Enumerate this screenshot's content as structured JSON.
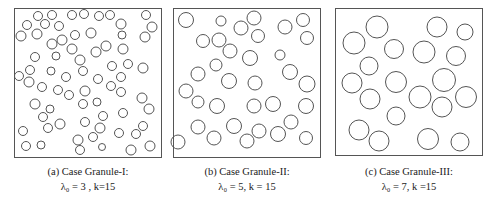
{
  "panels": [
    {
      "id": "a",
      "caption_line1": "(a) Case Granule-I:",
      "caption_line2": "λ₀ = 3 , k=15",
      "lambda0": 3,
      "k": 15,
      "box": {
        "x": 14,
        "y": 8,
        "w": 147,
        "h": 149
      },
      "stroke": "#555555",
      "circles": [
        [
          38,
          16,
          4.5
        ],
        [
          52,
          15,
          4.5
        ],
        [
          72,
          15,
          4.5
        ],
        [
          84,
          14,
          4.5
        ],
        [
          99,
          16,
          4.5
        ],
        [
          110,
          15,
          4.5
        ],
        [
          146,
          15,
          4.5
        ],
        [
          27,
          25,
          4.5
        ],
        [
          45,
          24,
          4.5
        ],
        [
          59,
          26,
          4.5
        ],
        [
          121,
          24,
          5
        ],
        [
          152,
          27,
          5
        ],
        [
          21,
          36,
          5
        ],
        [
          37,
          34,
          5
        ],
        [
          75,
          35,
          4.5
        ],
        [
          91,
          33,
          5
        ],
        [
          122,
          35,
          4
        ],
        [
          145,
          37,
          5
        ],
        [
          52,
          44,
          5
        ],
        [
          62,
          40,
          5
        ],
        [
          72,
          49,
          5
        ],
        [
          96,
          52,
          5
        ],
        [
          106,
          46,
          5
        ],
        [
          123,
          49,
          5
        ],
        [
          35,
          57,
          4.5
        ],
        [
          56,
          56,
          4
        ],
        [
          80,
          60,
          5
        ],
        [
          128,
          64,
          4.5
        ],
        [
          112,
          66,
          4.5
        ],
        [
          143,
          68,
          5
        ],
        [
          30,
          70,
          4.5
        ],
        [
          51,
          71,
          4
        ],
        [
          83,
          71,
          4.5
        ],
        [
          19,
          76,
          4.5
        ],
        [
          29,
          82,
          5
        ],
        [
          66,
          77,
          4.5
        ],
        [
          98,
          79,
          4.5
        ],
        [
          121,
          77,
          4.5
        ],
        [
          42,
          87,
          4.5
        ],
        [
          58,
          90,
          4.5
        ],
        [
          69,
          95,
          4.5
        ],
        [
          85,
          91,
          5
        ],
        [
          111,
          86,
          4.5
        ],
        [
          121,
          92,
          4.5
        ],
        [
          142,
          98,
          5
        ],
        [
          35,
          104,
          5
        ],
        [
          50,
          109,
          4
        ],
        [
          83,
          104,
          4.5
        ],
        [
          97,
          102,
          4
        ],
        [
          149,
          109,
          5
        ],
        [
          43,
          117,
          4.5
        ],
        [
          60,
          124,
          5
        ],
        [
          103,
          116,
          4.5
        ],
        [
          123,
          113,
          4.5
        ],
        [
          48,
          128,
          4.5
        ],
        [
          85,
          122,
          4.5
        ],
        [
          100,
          128,
          5
        ],
        [
          23,
          131,
          4.5
        ],
        [
          143,
          126,
          4.5
        ],
        [
          119,
          133,
          4.5
        ],
        [
          136,
          134,
          4.5
        ],
        [
          26,
          146,
          4.5
        ],
        [
          41,
          145,
          4
        ],
        [
          78,
          140,
          5
        ],
        [
          93,
          137,
          4.5
        ],
        [
          80,
          150,
          4.5
        ],
        [
          102,
          147,
          3.5
        ],
        [
          131,
          150,
          5
        ],
        [
          150,
          146,
          5
        ]
      ]
    },
    {
      "id": "b",
      "caption_line1": "(b) Case Granule-II:",
      "caption_line2": "λ₀ = 5, k = 15",
      "lambda0": 5,
      "k": 15,
      "box": {
        "x": 173,
        "y": 8,
        "w": 147,
        "h": 149
      },
      "stroke": "#555555",
      "circles": [
        [
          186,
          20,
          7.5
        ],
        [
          221,
          21,
          5
        ],
        [
          241,
          28,
          7
        ],
        [
          254,
          18,
          7
        ],
        [
          285,
          27,
          7
        ],
        [
          303,
          20,
          6.5
        ],
        [
          203,
          41,
          6.5
        ],
        [
          219,
          40,
          7
        ],
        [
          230,
          51,
          7
        ],
        [
          258,
          36,
          6.5
        ],
        [
          307,
          38,
          6.5
        ],
        [
          280,
          55,
          5
        ],
        [
          216,
          65,
          6
        ],
        [
          250,
          58,
          7.5
        ],
        [
          290,
          72,
          7.5
        ],
        [
          198,
          74,
          7
        ],
        [
          229,
          81,
          7.5
        ],
        [
          255,
          83,
          7
        ],
        [
          186,
          91,
          7
        ],
        [
          307,
          84,
          8
        ],
        [
          198,
          102,
          6
        ],
        [
          217,
          106,
          7.5
        ],
        [
          254,
          106,
          7
        ],
        [
          273,
          104,
          7.5
        ],
        [
          306,
          106,
          7.5
        ],
        [
          198,
          127,
          7
        ],
        [
          234,
          126,
          7.5
        ],
        [
          259,
          131,
          7
        ],
        [
          291,
          122,
          7
        ],
        [
          178,
          142,
          7
        ],
        [
          214,
          138,
          7
        ],
        [
          247,
          141,
          7
        ],
        [
          278,
          134,
          7.5
        ],
        [
          306,
          138,
          6.5
        ]
      ]
    },
    {
      "id": "c",
      "caption_line1": "(c) Case Granule-III:",
      "caption_line2": "λ₀ = 7, k =15",
      "lambda0": 7,
      "k": 15,
      "box": {
        "x": 335,
        "y": 8,
        "w": 147,
        "h": 147
      },
      "stroke": "#555555",
      "circles": [
        [
          377,
          27,
          11
        ],
        [
          437,
          27,
          10
        ],
        [
          465,
          32,
          8
        ],
        [
          354,
          43,
          11
        ],
        [
          394,
          49,
          9.5
        ],
        [
          424,
          52,
          11
        ],
        [
          456,
          56,
          9.5
        ],
        [
          369,
          66,
          9
        ],
        [
          352,
          83,
          10
        ],
        [
          396,
          82,
          10.5
        ],
        [
          444,
          80,
          11.5
        ],
        [
          370,
          99,
          10
        ],
        [
          420,
          97,
          11
        ],
        [
          442,
          107,
          10
        ],
        [
          466,
          97,
          10.5
        ],
        [
          396,
          116,
          9
        ],
        [
          359,
          130,
          10
        ],
        [
          379,
          141,
          10
        ],
        [
          428,
          139,
          10.5
        ],
        [
          460,
          142,
          9
        ]
      ]
    }
  ]
}
